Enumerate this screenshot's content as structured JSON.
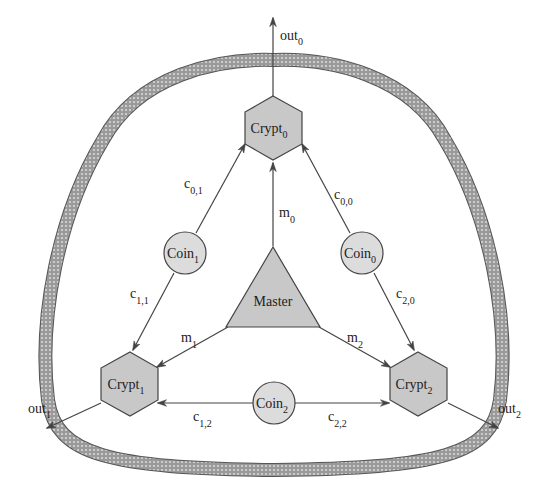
{
  "diagram": {
    "type": "network-architecture",
    "colors": {
      "background": "#ffffff",
      "node_fill": "#c8c8c8",
      "coin_fill": "#dcdcdc",
      "stroke": "#444444",
      "ring": "#7a7a7a",
      "text": "#222222"
    },
    "nodes": {
      "master": {
        "label": "Master",
        "shape": "triangle"
      },
      "crypt0": {
        "label": "Crypt",
        "sub": "0",
        "shape": "hexagon"
      },
      "crypt1": {
        "label": "Crypt",
        "sub": "1",
        "shape": "hexagon"
      },
      "crypt2": {
        "label": "Crypt",
        "sub": "2",
        "shape": "hexagon"
      },
      "coin0": {
        "label": "Coin",
        "sub": "0",
        "shape": "circle"
      },
      "coin1": {
        "label": "Coin",
        "sub": "1",
        "shape": "circle"
      },
      "coin2": {
        "label": "Coin",
        "sub": "2",
        "shape": "circle"
      }
    },
    "edges": {
      "m0": {
        "base": "m",
        "sub": "0",
        "from": "Master",
        "to": "Crypt0"
      },
      "m1": {
        "base": "m",
        "sub": "1",
        "from": "Master",
        "to": "Crypt1"
      },
      "m2": {
        "base": "m",
        "sub": "2",
        "from": "Master",
        "to": "Crypt2"
      },
      "c00": {
        "base": "c",
        "sub": "0,0",
        "from": "Coin0",
        "to": "Crypt0"
      },
      "c20": {
        "base": "c",
        "sub": "2,0",
        "from": "Coin0",
        "to": "Crypt2"
      },
      "c01": {
        "base": "c",
        "sub": "0,1",
        "from": "Coin1",
        "to": "Crypt0"
      },
      "c11": {
        "base": "c",
        "sub": "1,1",
        "from": "Coin1",
        "to": "Crypt1"
      },
      "c12": {
        "base": "c",
        "sub": "1,2",
        "from": "Coin2",
        "to": "Crypt1"
      },
      "c22": {
        "base": "c",
        "sub": "2,2",
        "from": "Coin2",
        "to": "Crypt2"
      }
    },
    "outputs": {
      "out0": {
        "base": "out",
        "sub": "0",
        "from": "Crypt0"
      },
      "out1": {
        "base": "out",
        "sub": "1",
        "from": "Crypt1"
      },
      "out2": {
        "base": "out",
        "sub": "2",
        "from": "Crypt2"
      }
    },
    "boundary": {
      "name": "shielded-enclosure",
      "style": "hatched-ring"
    }
  }
}
